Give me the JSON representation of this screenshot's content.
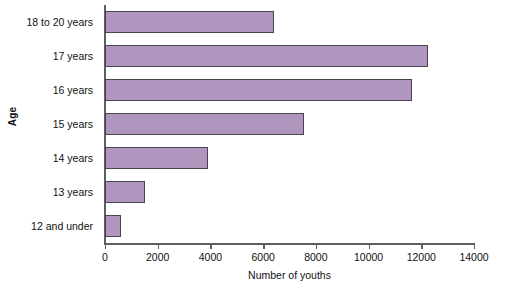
{
  "chart_data": {
    "type": "bar",
    "orientation": "horizontal",
    "title": "",
    "xlabel": "Number of youths",
    "ylabel": "Age",
    "categories": [
      "18 to 20 years",
      "17 years",
      "16 years",
      "15 years",
      "14 years",
      "13 years",
      "12 and under"
    ],
    "values": [
      6400,
      12250,
      11650,
      7550,
      3900,
      1500,
      600
    ],
    "xlim": [
      0,
      14000
    ],
    "xticks": [
      0,
      2000,
      4000,
      6000,
      8000,
      10000,
      12000,
      14000
    ],
    "xtick_labels": [
      "0",
      "2000",
      "4000",
      "6000",
      "8000",
      "10000",
      "12000",
      "14000"
    ],
    "grid": false,
    "legend": false,
    "bar_color": "#b095be",
    "bar_edge_color": "#4b4450",
    "axis_color": "#5d5d63"
  }
}
